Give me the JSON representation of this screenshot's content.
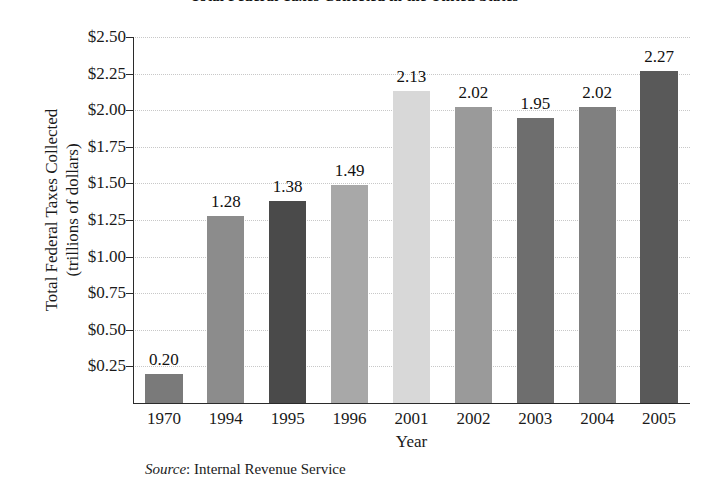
{
  "chart_data": {
    "type": "bar",
    "title": "Total Federal Taxes Collected in the United States",
    "xlabel": "Year",
    "ylabel_line1": "Total Federal Taxes Collected",
    "ylabel_line2": "(trillions of dollars)",
    "categories": [
      "1970",
      "1994",
      "1995",
      "1996",
      "2001",
      "2002",
      "2003",
      "2004",
      "2005"
    ],
    "values": [
      0.2,
      1.28,
      1.38,
      1.49,
      2.13,
      2.02,
      1.95,
      2.02,
      2.27
    ],
    "value_labels": [
      "0.20",
      "1.28",
      "1.38",
      "1.49",
      "2.13",
      "2.02",
      "1.95",
      "2.02",
      "2.27"
    ],
    "bar_colors": [
      "#7a7a7a",
      "#8c8c8c",
      "#4a4a4a",
      "#a8a8a8",
      "#d8d8d8",
      "#9a9a9a",
      "#6e6e6e",
      "#808080",
      "#595959"
    ],
    "ylim": [
      0.0,
      2.5
    ],
    "ytick_values": [
      2.5,
      2.25,
      2.0,
      1.75,
      1.5,
      1.25,
      1.0,
      0.75,
      0.5,
      0.25
    ],
    "ytick_labels": [
      "$2.50",
      "$2.25",
      "$2.00",
      "$1.75",
      "$1.50",
      "$1.25",
      "$1.00",
      "$0.75",
      "$0.50",
      "$0.25"
    ],
    "grid": true,
    "grid_style": "dotted",
    "grid_color": "#c8c8c8",
    "legend": false,
    "axis_color": "#2b2b2b",
    "background": "#ffffff"
  },
  "source": {
    "label": "Source",
    "separator": ": ",
    "text": "Internal Revenue Service"
  }
}
